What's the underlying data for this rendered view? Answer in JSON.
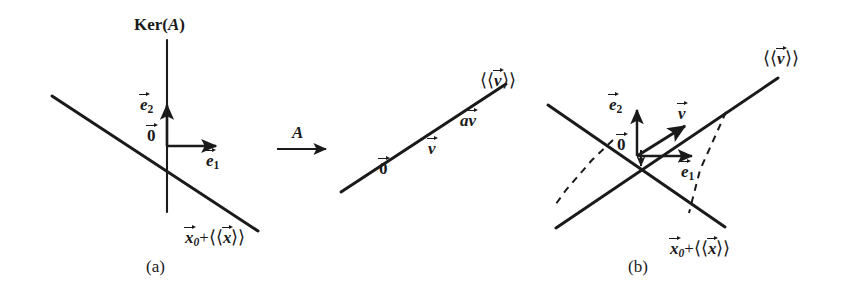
{
  "figure": {
    "type": "math-diagram",
    "background_color": "#ffffff",
    "ink_color": "#1a1a1a"
  },
  "panel_a": {
    "caption": "(a)",
    "kernel_label": "Ker(",
    "kernel_label_arg": "A",
    "kernel_label_close": ")",
    "origin_label": "0",
    "basis_e1": "e",
    "basis_e1_sub": "1",
    "basis_e2": "e",
    "basis_e2_sub": "2",
    "affine_x0": "x",
    "affine_x0_sub": "0",
    "affine_plus": "+",
    "affine_span_open": "⟨⟨",
    "affine_span_var": "x",
    "affine_span_close": "⟩⟩"
  },
  "map_arrow": {
    "label": "A"
  },
  "panel_mid": {
    "origin_label": "0",
    "vector_v": "v",
    "scaled_av_coef": "a",
    "scaled_av_vec": "v",
    "span_open": "⟨⟨",
    "span_var": "v",
    "span_close": "⟩⟩"
  },
  "panel_b": {
    "caption": "(b)",
    "origin_label": "0",
    "basis_e1": "e",
    "basis_e1_sub": "1",
    "basis_e2": "e",
    "basis_e2_sub": "2",
    "vector_v": "v",
    "span_open": "⟨⟨",
    "span_var": "v",
    "span_close": "⟩⟩",
    "affine_x0": "x",
    "affine_x0_sub": "0",
    "affine_plus": "+",
    "affine_span_open": "⟨⟨",
    "affine_span_var": "x",
    "affine_span_close": "⟩⟩"
  }
}
